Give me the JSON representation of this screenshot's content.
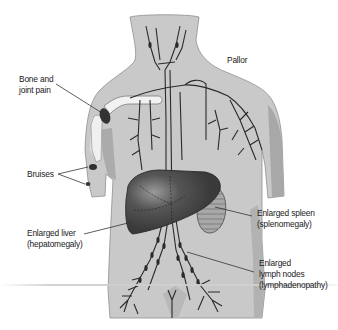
{
  "figure": {
    "type": "anatomical-illustration",
    "colors": {
      "skin": "#c9c9c9",
      "skin_shadow": "#a9a9a9",
      "outline": "#8a8a8a",
      "vessels": "#2a2a2a",
      "liver": "#4a4a4a",
      "spleen": "#9c9c9c",
      "bone": "#f2f2f2",
      "bruise": "#2e2e2e",
      "label_text": "#1a1a1a",
      "leader_line": "#333333"
    }
  },
  "labels": {
    "pallor": "Pallor",
    "bone_joint_pain": "Bone and\njoint pain",
    "bruises": "Bruises",
    "enlarged_liver": "Enlarged liver\n(hepatomegaly)",
    "enlarged_spleen": "Enlarged spleen\n(splenomegaly)",
    "enlarged_lymph_nodes": "Enlarged\nlymph nodes\n(lymphadenopathy)"
  }
}
